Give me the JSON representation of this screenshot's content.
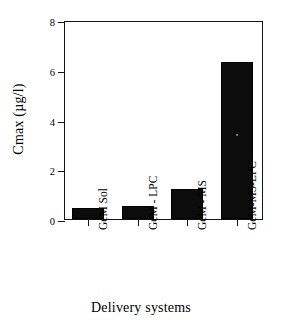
{
  "chart_data": {
    "type": "bar",
    "title": "",
    "xlabel": "Delivery systems",
    "ylabel": "Cmax (µg/l)",
    "categories": [
      "GeM Sol",
      "GeM - LPC",
      "GeM - MS",
      "GeM-MS-LPC"
    ],
    "values": [
      0.45,
      0.52,
      1.2,
      6.3
    ],
    "ylim": [
      0,
      8
    ],
    "yticks": [
      0,
      2,
      4,
      6,
      8
    ],
    "ytick_labels": [
      "0",
      "2",
      "4",
      "6",
      "8"
    ],
    "grid": false,
    "legend": null,
    "bar_color": "#0c0c0c",
    "axis_color": "#141414",
    "background": "#ffffff"
  },
  "axes": {
    "y_title": "Cmax (µg/l)",
    "x_title": "Delivery systems"
  }
}
